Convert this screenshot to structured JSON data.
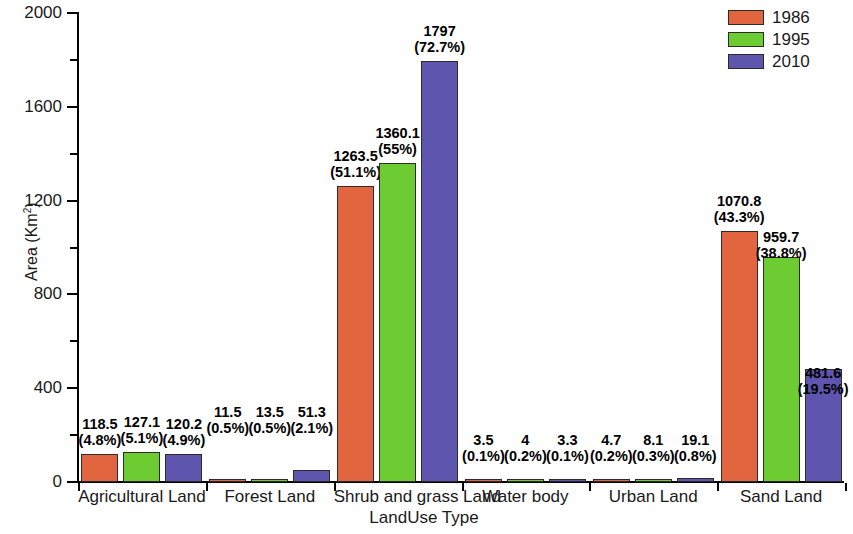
{
  "chart_data": {
    "type": "bar",
    "title": "",
    "xlabel": "LandUse Type",
    "ylabel": "Area (Km2)",
    "ylabel_base": "Area (Km",
    "ylabel_sup": "2",
    "ylabel_tail": ")",
    "ylim": [
      0,
      2000
    ],
    "grid": false,
    "legend_position": "top-right",
    "ytick_major": [
      "0",
      "400",
      "800",
      "1200",
      "1600",
      "2000"
    ],
    "ytick_major_values": [
      0,
      400,
      800,
      1200,
      1600,
      2000
    ],
    "ytick_minor_values": [
      200,
      600,
      1000,
      1400,
      1800
    ],
    "categories": [
      "Agricultural Land",
      "Forest Land",
      "Shrub and grass Land",
      "Water body",
      "Urban Land",
      "Sand Land"
    ],
    "series": [
      {
        "name": "1986",
        "color": "#e2653f",
        "values": [
          118.5,
          11.5,
          1263.5,
          3.5,
          4.7,
          1070.8
        ],
        "value_labels": [
          "118.5",
          "11.5",
          "1263.5",
          "3.5",
          "4.7",
          "1070.8"
        ],
        "percent_labels": [
          "(4.8%)",
          "(0.5%)",
          "(51.1%)",
          "(0.1%)",
          "(0.2%)",
          "(43.3%)"
        ]
      },
      {
        "name": "1995",
        "color": "#6ecc33",
        "values": [
          127.1,
          13.5,
          1360.1,
          4,
          8.1,
          959.7
        ],
        "value_labels": [
          "127.1",
          "13.5",
          "1360.1",
          "4",
          "8.1",
          "959.7"
        ],
        "percent_labels": [
          "(5.1%)",
          "(0.5%)",
          "(55%)",
          "(0.2%)",
          "(0.3%)",
          "(38.8%)"
        ]
      },
      {
        "name": "2010",
        "color": "#5d55ae",
        "values": [
          120.2,
          51.3,
          1797,
          3.3,
          19.1,
          481.6
        ],
        "value_labels": [
          "120.2",
          "51.3",
          "1797",
          "3.3",
          "19.1",
          "481.6"
        ],
        "percent_labels": [
          "(4.9%)",
          "(2.1%)",
          "(72.7%)",
          "(0.1%)",
          "(0.8%)",
          "(19.5%)"
        ]
      }
    ]
  },
  "legend": {
    "entries": [
      {
        "label": "1986",
        "color": "#e2653f"
      },
      {
        "label": "1995",
        "color": "#6ecc33"
      },
      {
        "label": "2010",
        "color": "#5d55ae"
      }
    ]
  }
}
